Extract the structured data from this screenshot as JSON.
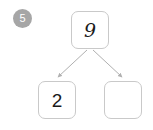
{
  "exercise": {
    "number_badge": "5",
    "badge_color": "#a6a6a6",
    "badge_text_color": "#ffffff"
  },
  "diagram": {
    "type": "number-bond",
    "box_border_color": "#c9c9c9",
    "connector_color": "#b0b0b0",
    "parent": {
      "value": "9",
      "filled": true
    },
    "children": [
      {
        "value": "2",
        "filled": true
      },
      {
        "value": "",
        "filled": false
      }
    ]
  }
}
